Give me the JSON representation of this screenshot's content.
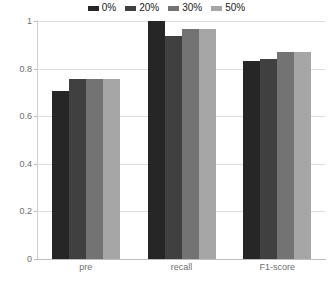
{
  "legend": {
    "position": "top-center",
    "items": [
      {
        "label": "0%",
        "color": "#262626",
        "swatch_name": "legend-swatch-0"
      },
      {
        "label": "20%",
        "color": "#404040",
        "swatch_name": "legend-swatch-20"
      },
      {
        "label": "30%",
        "color": "#737373",
        "swatch_name": "legend-swatch-30"
      },
      {
        "label": "50%",
        "color": "#a6a6a6",
        "swatch_name": "legend-swatch-50"
      }
    ]
  },
  "axis": {
    "y_ticks": [
      "1",
      "0.8",
      "0.6",
      "0.4",
      "0.2",
      "0"
    ],
    "x_ticks": [
      "pre",
      "recall",
      "F1-score"
    ]
  },
  "chart_data": {
    "type": "bar",
    "title": "",
    "xlabel": "",
    "ylabel": "",
    "ylim": [
      0,
      1
    ],
    "yticks": [
      0,
      0.2,
      0.4,
      0.6,
      0.8,
      1
    ],
    "grid": true,
    "legend_position": "top-center",
    "categories": [
      "pre",
      "recall",
      "F1-score"
    ],
    "series": [
      {
        "name": "0%",
        "color": "#262626",
        "values": [
          0.705,
          1.0,
          0.83
        ]
      },
      {
        "name": "20%",
        "color": "#404040",
        "values": [
          0.757,
          0.935,
          0.84
        ]
      },
      {
        "name": "30%",
        "color": "#737373",
        "values": [
          0.757,
          0.965,
          0.87
        ]
      },
      {
        "name": "50%",
        "color": "#a6a6a6",
        "values": [
          0.757,
          0.965,
          0.87
        ]
      }
    ]
  }
}
